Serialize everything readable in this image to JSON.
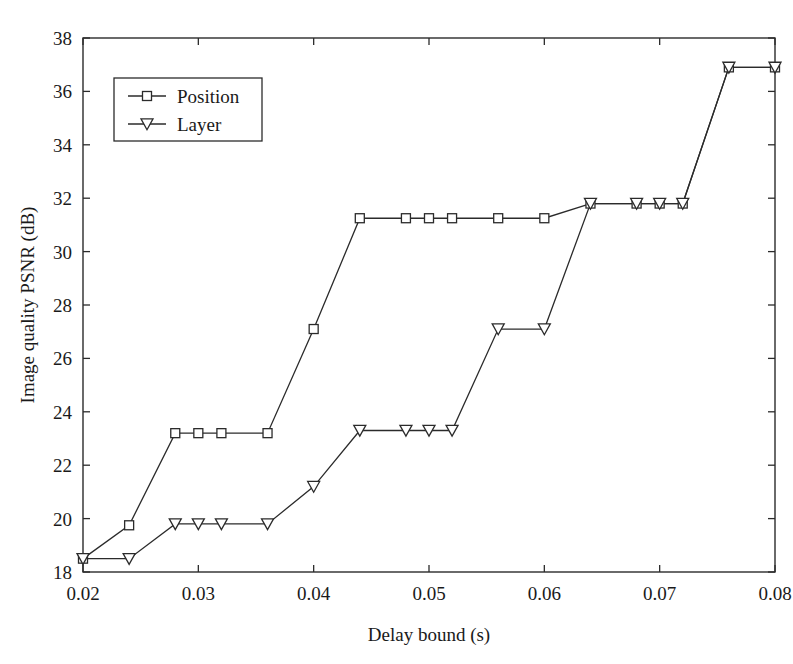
{
  "chart_data": {
    "type": "line",
    "title": "",
    "xlabel": "Delay bound (s)",
    "ylabel": "Image quality PSNR (dB)",
    "xlim": [
      0.02,
      0.08
    ],
    "ylim": [
      18,
      38
    ],
    "xticks": [
      0.02,
      0.03,
      0.04,
      0.05,
      0.06,
      0.07,
      0.08
    ],
    "xtick_labels": [
      "0.02",
      "0.03",
      "0.04",
      "0.05",
      "0.06",
      "0.07",
      "0.08"
    ],
    "yticks": [
      18,
      20,
      22,
      24,
      26,
      28,
      30,
      32,
      34,
      36,
      38
    ],
    "ytick_labels": [
      "18",
      "20",
      "22",
      "24",
      "26",
      "28",
      "30",
      "32",
      "34",
      "36",
      "38"
    ],
    "grid": false,
    "legend_position": "upper left",
    "series": [
      {
        "name": "Position",
        "marker": "square",
        "color": "#2b2b2b",
        "x": [
          0.02,
          0.024,
          0.028,
          0.03,
          0.032,
          0.036,
          0.04,
          0.044,
          0.048,
          0.05,
          0.052,
          0.056,
          0.06,
          0.064,
          0.068,
          0.07,
          0.072,
          0.076,
          0.08
        ],
        "y": [
          18.5,
          19.75,
          23.2,
          23.2,
          23.2,
          23.2,
          27.1,
          31.25,
          31.25,
          31.25,
          31.25,
          31.25,
          31.25,
          31.8,
          31.8,
          31.8,
          31.8,
          36.9,
          36.9
        ]
      },
      {
        "name": "Layer",
        "marker": "triangle-down",
        "color": "#2b2b2b",
        "x": [
          0.02,
          0.024,
          0.028,
          0.03,
          0.032,
          0.036,
          0.04,
          0.044,
          0.048,
          0.05,
          0.052,
          0.056,
          0.06,
          0.064,
          0.068,
          0.07,
          0.072,
          0.076,
          0.08
        ],
        "y": [
          18.5,
          18.5,
          19.8,
          19.8,
          19.8,
          19.8,
          21.2,
          23.3,
          23.3,
          23.3,
          23.3,
          27.1,
          27.1,
          31.8,
          31.8,
          31.8,
          31.8,
          36.9,
          36.9
        ]
      }
    ]
  },
  "legend": {
    "entries": [
      {
        "label": "Position"
      },
      {
        "label": "Layer"
      }
    ]
  }
}
